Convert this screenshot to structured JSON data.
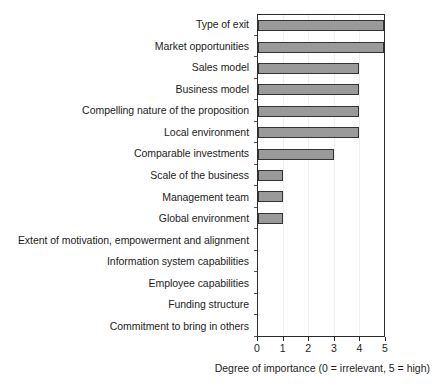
{
  "chart_data": {
    "type": "bar",
    "orientation": "horizontal",
    "title": "",
    "xlabel": "Degree of importance (0 = irrelevant, 5 = high)",
    "ylabel": "",
    "xlim": [
      0,
      5
    ],
    "xticks": [
      0,
      1,
      2,
      3,
      4,
      5
    ],
    "xtick_labels": [
      "0",
      "1",
      "2",
      "3",
      "4",
      "5"
    ],
    "grid": true,
    "legend": false,
    "bar_color": "#9a9a9a",
    "bar_edge_color": "#333333",
    "categories": [
      "Type of exit",
      "Market opportunities",
      "Sales model",
      "Business model",
      "Compelling nature of the proposition",
      "Local environment",
      "Comparable investments",
      "Scale of the business",
      "Management team",
      "Global environment",
      "Extent of motivation, empowerment and alignment",
      "Information system capabilities",
      "Employee capabilities",
      "Funding structure",
      "Commitment to bring in others"
    ],
    "values": [
      5,
      5,
      4,
      4,
      4,
      4,
      3,
      1,
      1,
      1,
      0,
      0,
      0,
      0,
      0
    ]
  }
}
